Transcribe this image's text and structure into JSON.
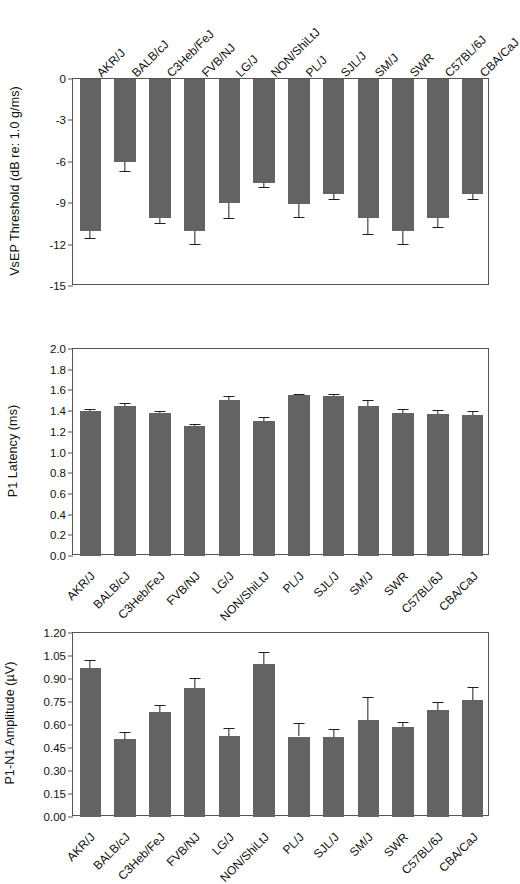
{
  "figure": {
    "strains": [
      "AKR/J",
      "BALB/cJ",
      "C3Heb/FeJ",
      "FVB/NJ",
      "LG/J",
      "NON/ShiLtJ",
      "PL/J",
      "SJL/J",
      "SM/J",
      "SWR",
      "C57BL/6J",
      "CBA/CaJ"
    ],
    "bar_color": "#636363",
    "axis_color": "#555555",
    "background": "#ffffff"
  },
  "chart_data": [
    {
      "type": "bar",
      "id": "vsep-threshold",
      "title": "",
      "xlabel": "",
      "ylabel": "VsEP Threshold (dB re: 1.0 g/ms)",
      "ylim": [
        -15,
        0
      ],
      "yticks": [
        0,
        -3,
        -6,
        -9,
        -12,
        -15
      ],
      "ytick_labels": [
        "0",
        "-3",
        "-6",
        "-9",
        "-12",
        "-15"
      ],
      "grid": false,
      "legend": "none",
      "xtick_position": "top",
      "categories": [
        "AKR/J",
        "BALB/cJ",
        "C3Heb/FeJ",
        "FVB/NJ",
        "LG/J",
        "NON/ShiLtJ",
        "PL/J",
        "SJL/J",
        "SM/J",
        "SWR",
        "C57BL/6J",
        "CBA/CaJ"
      ],
      "values": [
        -11.0,
        -6.05,
        -10.1,
        -11.0,
        -9.0,
        -7.5,
        -9.05,
        -8.35,
        -10.1,
        -11.0,
        -10.1,
        -8.35
      ],
      "errors": [
        0.55,
        0.6,
        0.35,
        0.95,
        1.1,
        0.35,
        0.95,
        0.35,
        1.1,
        0.95,
        0.6,
        0.35
      ]
    },
    {
      "type": "bar",
      "id": "p1-latency",
      "title": "",
      "xlabel": "",
      "ylabel": "P1 Latency (ms)",
      "ylim": [
        0.0,
        2.0
      ],
      "yticks": [
        0.0,
        0.2,
        0.4,
        0.6,
        0.8,
        1.0,
        1.2,
        1.4,
        1.6,
        1.8,
        2.0
      ],
      "ytick_labels": [
        "0.0",
        "0.2",
        "0.4",
        "0.6",
        "0.8",
        "1.0",
        "1.2",
        "1.4",
        "1.6",
        "1.8",
        "2.0"
      ],
      "grid": false,
      "legend": "none",
      "xtick_position": "bottom",
      "categories": [
        "AKR/J",
        "BALB/cJ",
        "C3Heb/FeJ",
        "FVB/NJ",
        "LG/J",
        "NON/ShiLtJ",
        "PL/J",
        "SJL/J",
        "SM/J",
        "SWR",
        "C57BL/6J",
        "CBA/CaJ"
      ],
      "values": [
        1.4,
        1.45,
        1.385,
        1.255,
        1.505,
        1.305,
        1.555,
        1.55,
        1.445,
        1.385,
        1.37,
        1.36
      ],
      "errors": [
        0.02,
        0.025,
        0.012,
        0.022,
        0.04,
        0.04,
        0.015,
        0.02,
        0.065,
        0.04,
        0.045,
        0.045
      ]
    },
    {
      "type": "bar",
      "id": "p1-n1-amplitude",
      "title": "",
      "xlabel": "",
      "ylabel": "P1-N1 Amplitude (µV)",
      "ylim": [
        0.0,
        1.2
      ],
      "yticks": [
        0.0,
        0.15,
        0.3,
        0.45,
        0.6,
        0.75,
        0.9,
        1.05,
        1.2
      ],
      "ytick_labels": [
        "0.00",
        "0.15",
        "0.30",
        "0.45",
        "0.60",
        "0.75",
        "0.90",
        "1.05",
        "1.20"
      ],
      "grid": false,
      "legend": "none",
      "xtick_position": "bottom",
      "categories": [
        "AKR/J",
        "BALB/cJ",
        "C3Heb/FeJ",
        "FVB/NJ",
        "LG/J",
        "NON/ShiLtJ",
        "PL/J",
        "SJL/J",
        "SM/J",
        "SWR",
        "C57BL/6J",
        "CBA/CaJ"
      ],
      "values": [
        0.97,
        0.51,
        0.685,
        0.84,
        0.53,
        0.995,
        0.525,
        0.52,
        0.63,
        0.585,
        0.695,
        0.765
      ],
      "errors": [
        0.055,
        0.045,
        0.045,
        0.065,
        0.05,
        0.08,
        0.09,
        0.055,
        0.15,
        0.035,
        0.055,
        0.085
      ]
    }
  ]
}
